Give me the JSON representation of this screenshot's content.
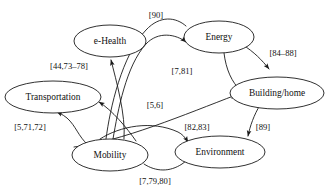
{
  "diagram": {
    "type": "directed-graph",
    "background_color": "#ffffff",
    "stroke_color": "#1a1a1a",
    "text_color": "#111111",
    "nodes": [
      {
        "id": "e-health",
        "label": "e-Health",
        "cx": 110,
        "cy": 41,
        "rx": 36,
        "ry": 16
      },
      {
        "id": "energy",
        "label": "Energy",
        "cx": 219,
        "cy": 37,
        "rx": 35,
        "ry": 16
      },
      {
        "id": "transportation",
        "label": "Transportation",
        "cx": 53,
        "cy": 97,
        "rx": 48,
        "ry": 16
      },
      {
        "id": "building-home",
        "label": "Building/home",
        "cx": 277,
        "cy": 93,
        "rx": 47,
        "ry": 16
      },
      {
        "id": "mobility",
        "label": "Mobility",
        "cx": 110,
        "cy": 155,
        "rx": 38,
        "ry": 16
      },
      {
        "id": "environment",
        "label": "Environment",
        "cx": 220,
        "cy": 152,
        "rx": 45,
        "ry": 16
      }
    ],
    "edge_labels": [
      {
        "id": "label-90",
        "text": "[90]",
        "x": 156,
        "y": 16
      },
      {
        "id": "label-44-73-78",
        "text": "[44,73–78]",
        "x": 69,
        "y": 67
      },
      {
        "id": "label-84-88",
        "text": "[84–88]",
        "x": 283,
        "y": 54
      },
      {
        "id": "label-7-81",
        "text": "[7,81]",
        "x": 182,
        "y": 72
      },
      {
        "id": "label-5-6",
        "text": "[5,6]",
        "x": 155,
        "y": 106
      },
      {
        "id": "label-5-71-72",
        "text": "[5,71,72]",
        "x": 30,
        "y": 128
      },
      {
        "id": "label-82-83",
        "text": "[82,83]",
        "x": 197,
        "y": 128
      },
      {
        "id": "label-89",
        "text": "[89]",
        "x": 263,
        "y": 128
      },
      {
        "id": "label-7-79-80",
        "text": "[7,79,80]",
        "x": 155,
        "y": 182
      }
    ],
    "edges": [
      {
        "id": "mobility-to-ehealth",
        "from": "Mobility",
        "to": "e-Health",
        "label": "[44,73–78]"
      },
      {
        "id": "mobility-to-transportation-upper",
        "from": "Mobility",
        "to": "Transportation",
        "label": "[44,73–78]"
      },
      {
        "id": "mobility-to-energy",
        "from": "Mobility",
        "to": "Energy",
        "label": "[90]"
      },
      {
        "id": "energy-to-building",
        "from": "Energy",
        "to": "Building/home",
        "label": "[84–88]"
      },
      {
        "id": "energy-to-building-left",
        "from": "Energy",
        "to": "Building/home",
        "label": "[7,81]"
      },
      {
        "id": "mobility-to-building",
        "from": "Mobility",
        "to": "Building/home",
        "label": "[5,6]"
      },
      {
        "id": "mobility-to-transportation-lower",
        "from": "Mobility",
        "to": "Transportation",
        "label": "[5,71,72]"
      },
      {
        "id": "mobility-to-environment-upper",
        "from": "Mobility",
        "to": "Environment",
        "label": "[82,83]"
      },
      {
        "id": "mobility-to-environment-lower",
        "from": "Mobility",
        "to": "Environment",
        "label": "[7,79,80]"
      },
      {
        "id": "building-to-environment",
        "from": "Building/home",
        "to": "Environment",
        "label": "[89]"
      }
    ]
  }
}
